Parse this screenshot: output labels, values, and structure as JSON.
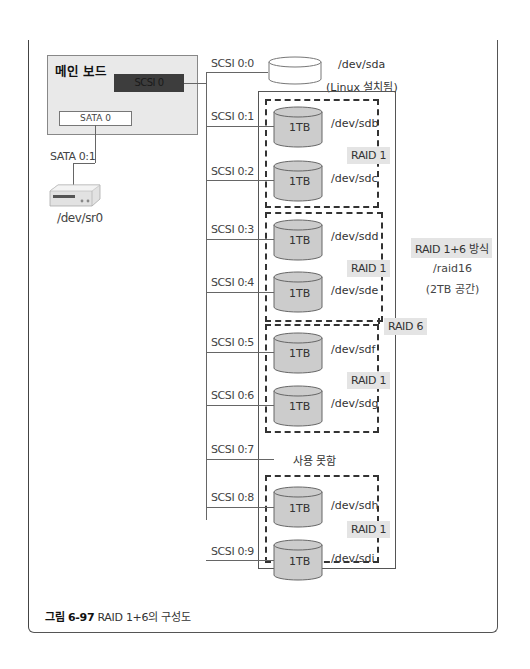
{
  "main_board": {
    "title": "메인 보드",
    "scsi_controller": "SCSI 0",
    "sata_controller": "SATA 0"
  },
  "sata": {
    "port_label": "SATA 0:1",
    "device": "/dev/sr0",
    "device_icon": "optical-drive-icon"
  },
  "system_disk": {
    "port_label": "SCSI 0:0",
    "device": "/dev/sda",
    "note": "(Linux 설치됨)"
  },
  "ports": [
    {
      "label": "SCSI 0:1",
      "size": "1TB",
      "device": "/dev/sdb"
    },
    {
      "label": "SCSI 0:2",
      "size": "1TB",
      "device": "/dev/sdc"
    },
    {
      "label": "SCSI 0:3",
      "size": "1TB",
      "device": "/dev/sdd"
    },
    {
      "label": "SCSI 0:4",
      "size": "1TB",
      "device": "/dev/sde"
    },
    {
      "label": "SCSI 0:5",
      "size": "1TB",
      "device": "/dev/sdf"
    },
    {
      "label": "SCSI 0:6",
      "size": "1TB",
      "device": "/dev/sdg"
    },
    {
      "label": "SCSI 0:7",
      "size": "",
      "device": "사용 못함"
    },
    {
      "label": "SCSI 0:8",
      "size": "1TB",
      "device": "/dev/sdh"
    },
    {
      "label": "SCSI 0:9",
      "size": "1TB",
      "device": "/dev/sdi"
    }
  ],
  "raid_groups": [
    {
      "label": "RAID 1",
      "members": [
        "/dev/sdb",
        "/dev/sdc"
      ]
    },
    {
      "label": "RAID 1",
      "members": [
        "/dev/sdd",
        "/dev/sde"
      ]
    },
    {
      "label": "RAID 1",
      "members": [
        "/dev/sdf",
        "/dev/sdg"
      ]
    },
    {
      "label": "RAID 1",
      "members": [
        "/dev/sdh",
        "/dev/sdi"
      ]
    }
  ],
  "raid6": {
    "label": "RAID 6"
  },
  "array_info": {
    "method": "RAID 1+6 방식",
    "device": "/raid16",
    "capacity": "(2TB 공간)"
  },
  "caption": {
    "figure_no": "그림 6-97",
    "text": " RAID 1+6의 구성도"
  }
}
